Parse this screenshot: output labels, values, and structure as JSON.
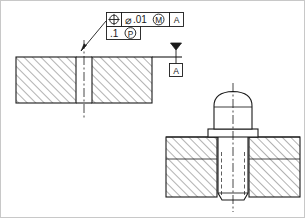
{
  "drawing": {
    "title": "Positional tolerance with projected tolerance zone",
    "background_color": "#ffffff",
    "line_color": "#1a1a1a",
    "hatch_color": "#555555",
    "border": {
      "visible": true,
      "color": "#c8c8c8"
    }
  },
  "feature_control_frame": {
    "row1": {
      "geometric_characteristic_symbol": "position-symbol",
      "diameter_symbol": "⌀",
      "tolerance_value": ".01",
      "material_condition_symbol": "M",
      "material_condition_meaning": "maximum-material-condition",
      "datum_reference": "A"
    },
    "row2": {
      "projected_zone_height": ".1",
      "projected_zone_symbol": "P",
      "projected_zone_meaning": "projected-tolerance-zone"
    }
  },
  "datum_feature": {
    "label": "A",
    "symbol": "filled-triangle"
  },
  "views": {
    "section_view": {
      "name": "plate-section-with-hole",
      "hatch_angle_deg": 45,
      "has_centerline": true
    },
    "assembly_view": {
      "name": "bolt-in-tapped-hole-assembly",
      "hatch_angle_deg": 45,
      "has_centerline": true,
      "has_hidden_thread_lines": true
    }
  }
}
